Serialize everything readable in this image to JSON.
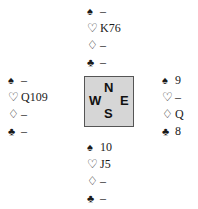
{
  "hands": {
    "north": {
      "spades": "–",
      "hearts": "K76",
      "diamonds": "–",
      "clubs": "–"
    },
    "west": {
      "spades": "–",
      "hearts": "Q109",
      "diamonds": "–",
      "clubs": "–"
    },
    "east": {
      "spades": "9",
      "hearts": "–",
      "diamonds": "Q",
      "clubs": "8"
    },
    "south": {
      "spades": "10",
      "hearts": "J5",
      "diamonds": "–",
      "clubs": "–"
    }
  },
  "suit_icons": {
    "spades": "♠",
    "hearts": "♡",
    "diamonds": "♢",
    "clubs": "♣"
  },
  "compass": {
    "north": "N",
    "west": "W",
    "east": "E",
    "south": "S"
  },
  "colors": {
    "compass_bg": "#d6d6d6",
    "compass_border": "#555555",
    "text": "#1a1a1a"
  }
}
